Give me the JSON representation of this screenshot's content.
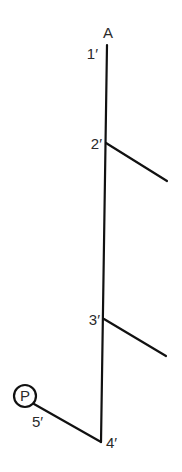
{
  "diagram": {
    "colors": {
      "line": "#111111",
      "text": "#2a2a2a",
      "background": "#ffffff"
    },
    "node_top_label": "A",
    "marker": {
      "label": "P"
    },
    "points": [
      {
        "id": "1",
        "label": "1′"
      },
      {
        "id": "2",
        "label": "2′"
      },
      {
        "id": "3",
        "label": "3′"
      },
      {
        "id": "4",
        "label": "4′"
      },
      {
        "id": "5",
        "label": "5′"
      }
    ]
  }
}
